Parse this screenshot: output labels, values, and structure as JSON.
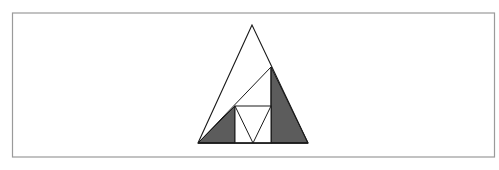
{
  "figure": {
    "colors": {
      "background": "#ffffff",
      "frame": "#9a9a9a",
      "stroke": "#1a1a1a",
      "shade": "#5c5c5c"
    },
    "frame": {
      "x": 12,
      "y": 13,
      "width": 482,
      "height": 144
    },
    "outer_triangle": {
      "apex": [
        252,
        25
      ],
      "bottom_left": [
        198,
        143
      ],
      "bottom_right": [
        308,
        143
      ]
    },
    "diagonal": {
      "from": [
        198,
        143
      ],
      "to": [
        271,
        67
      ]
    },
    "inner_square": {
      "x": 235,
      "y": 106,
      "width": 36,
      "height": 37
    },
    "inner_v": {
      "left": [
        235,
        106
      ],
      "bottom": [
        253,
        143
      ],
      "right": [
        271,
        106
      ]
    },
    "shaded_regions": [
      {
        "name": "left-shaded-triangle",
        "points": [
          [
            198,
            143
          ],
          [
            235,
            106
          ],
          [
            235,
            143
          ]
        ]
      },
      {
        "name": "right-shaded-triangle",
        "points": [
          [
            271,
            67
          ],
          [
            308,
            143
          ],
          [
            271,
            143
          ]
        ]
      }
    ]
  }
}
